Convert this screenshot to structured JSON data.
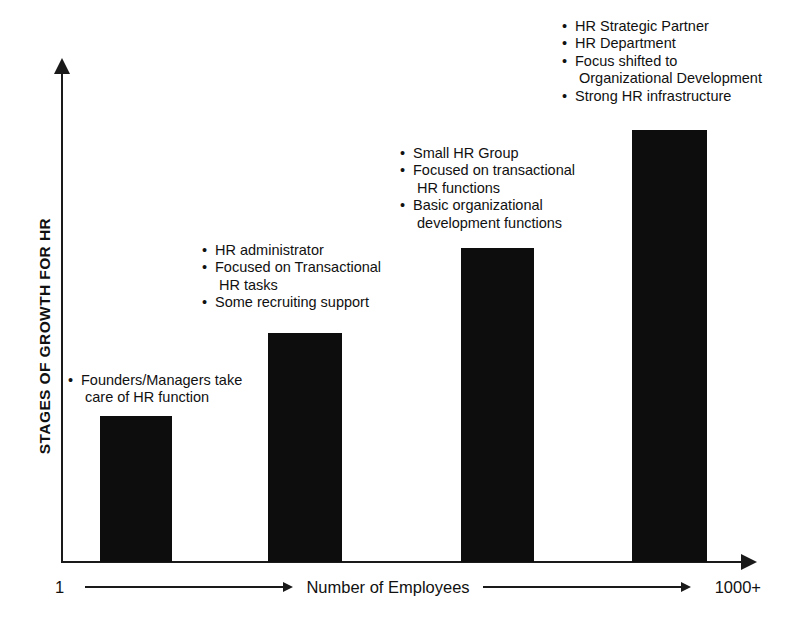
{
  "chart_data": {
    "type": "bar",
    "title": "",
    "subtitle": "",
    "xlabel": "Number of Employees",
    "ylabel": "STAGES OF GROWTH FOR HR",
    "grid": false,
    "legend": "none",
    "x_axis_start_label": "1",
    "x_axis_end_label": "1000+",
    "xlim_labels": [
      "1",
      "1000+"
    ],
    "ylim": [
      0,
      100
    ],
    "bar_color": "#0d0d0d",
    "axis_color": "#1a1a1a",
    "categories": [
      "Stage 1",
      "Stage 2",
      "Stage 3",
      "Stage 4"
    ],
    "values": [
      30,
      47,
      64,
      88
    ],
    "bars": [
      {
        "stage": 1,
        "value": 30,
        "left_px": 100,
        "width_px": 72,
        "height_px": 146,
        "annotations": [
          {
            "bullet": true,
            "text": "Founders/Managers take"
          },
          {
            "bullet": false,
            "text": "care of HR function"
          }
        ]
      },
      {
        "stage": 2,
        "value": 47,
        "left_px": 268,
        "width_px": 74,
        "height_px": 229,
        "annotations": [
          {
            "bullet": true,
            "text": "HR administrator"
          },
          {
            "bullet": true,
            "text": "Focused on Transactional"
          },
          {
            "bullet": false,
            "text": "HR tasks"
          },
          {
            "bullet": true,
            "text": "Some recruiting support"
          }
        ]
      },
      {
        "stage": 3,
        "value": 64,
        "left_px": 461,
        "width_px": 73,
        "height_px": 314,
        "annotations": [
          {
            "bullet": true,
            "text": "Small HR Group"
          },
          {
            "bullet": true,
            "text": "Focused on transactional"
          },
          {
            "bullet": false,
            "text": "HR functions"
          },
          {
            "bullet": true,
            "text": "Basic organizational"
          },
          {
            "bullet": false,
            "text": "development functions"
          }
        ]
      },
      {
        "stage": 4,
        "value": 88,
        "left_px": 632,
        "width_px": 75,
        "height_px": 432,
        "annotations": [
          {
            "bullet": true,
            "text": "HR Strategic Partner"
          },
          {
            "bullet": true,
            "text": "HR Department"
          },
          {
            "bullet": true,
            "text": "Focus shifted to"
          },
          {
            "bullet": false,
            "text": "Organizational Development"
          },
          {
            "bullet": true,
            "text": "Strong HR infrastructure"
          }
        ]
      }
    ],
    "annotation_blocks": [
      {
        "left_px": 68,
        "top_px": 372
      },
      {
        "left_px": 202,
        "top_px": 242
      },
      {
        "left_px": 400,
        "top_px": 145
      },
      {
        "left_px": 562,
        "top_px": 18
      }
    ]
  }
}
